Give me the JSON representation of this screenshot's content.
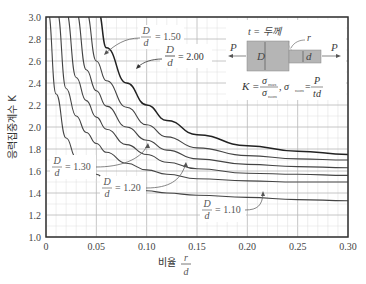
{
  "chart_data": {
    "type": "line",
    "title": "",
    "xlabel": "비율 r/d",
    "xlabel_prefix": "비율",
    "xlabel_num": "r",
    "xlabel_den": "d",
    "ylabel": "응력집중계수 K",
    "xlim": [
      0,
      0.3
    ],
    "ylim": [
      1.0,
      3.0
    ],
    "grid": true,
    "x_ticks": [
      "0",
      "0.05",
      "0.10",
      "0.15",
      "0.20",
      "0.25",
      "0.30"
    ],
    "y_ticks": [
      "1.0",
      "1.2",
      "1.4",
      "1.6",
      "1.8",
      "2.0",
      "2.2",
      "2.4",
      "2.6",
      "2.8",
      "3.0"
    ],
    "x": [
      0.01,
      0.02,
      0.03,
      0.04,
      0.05,
      0.06,
      0.08,
      0.1,
      0.12,
      0.15,
      0.2,
      0.25,
      0.3
    ],
    "series": [
      {
        "name": "D/d = 2.00",
        "values": [
          null,
          null,
          null,
          null,
          2.95,
          2.72,
          2.4,
          2.2,
          2.06,
          1.93,
          1.83,
          1.78,
          1.75
        ]
      },
      {
        "name": "D/d = 1.50",
        "values": [
          null,
          null,
          null,
          2.85,
          2.6,
          2.42,
          2.18,
          2.02,
          1.91,
          1.81,
          1.74,
          1.71,
          1.7
        ]
      },
      {
        "name": "D/d = 1.30 (upper)",
        "values": [
          null,
          null,
          2.8,
          2.52,
          2.33,
          2.19,
          2.0,
          1.88,
          1.79,
          1.71,
          1.66,
          1.64,
          1.63
        ]
      },
      {
        "name": "D/d = 1.30",
        "values": [
          null,
          2.8,
          2.45,
          2.24,
          2.09,
          1.98,
          1.84,
          1.75,
          1.68,
          1.62,
          1.58,
          1.57,
          1.56
        ]
      },
      {
        "name": "D/d = 1.20",
        "values": [
          2.85,
          2.35,
          2.1,
          1.95,
          1.85,
          1.77,
          1.67,
          1.61,
          1.57,
          1.53,
          1.51,
          1.5,
          1.5
        ]
      },
      {
        "name": "D/d = 1.10",
        "values": [
          2.3,
          1.9,
          1.72,
          1.63,
          1.57,
          1.52,
          1.46,
          1.42,
          1.4,
          1.38,
          1.36,
          1.34,
          1.33
        ]
      }
    ],
    "annotations": [
      {
        "label": "D/d = 1.50",
        "num": "D",
        "den": "d",
        "value": "= 1.50"
      },
      {
        "label": "D/d = 2.00",
        "num": "D",
        "den": "d",
        "value": "= 2.00"
      },
      {
        "label": "D/d = 1.30",
        "num": "D",
        "den": "d",
        "value": "= 1.30"
      },
      {
        "label": "D/d = 1.20",
        "num": "D",
        "den": "d",
        "value": "= 1.20"
      },
      {
        "label": "D/d = 1.10",
        "num": "D",
        "den": "d",
        "value": "= 1.10"
      }
    ],
    "inset": {
      "thickness_label": "t = 두께",
      "load_left": "P",
      "load_right": "P",
      "big_dim": "D",
      "small_dim": "d",
      "fillet": "r",
      "formula_k": "K =",
      "sigma": "σ",
      "sub_max": "max",
      "sub_nom": "nom",
      "formula_nom": ", σ",
      "eq": "=",
      "P": "P",
      "td": "td"
    }
  }
}
